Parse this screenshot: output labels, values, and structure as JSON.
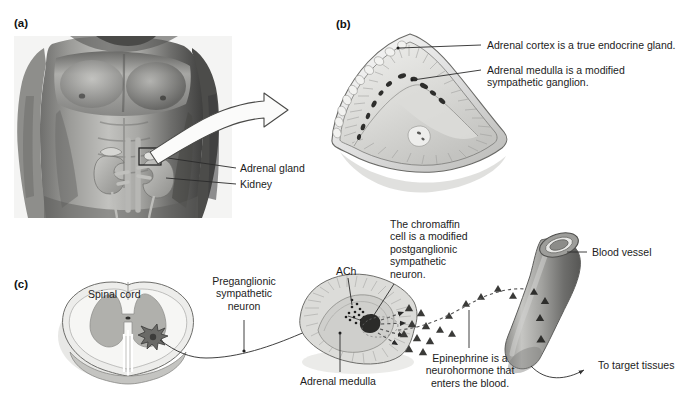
{
  "figure": {
    "background": "#ffffff",
    "ink": "#1c1c1c"
  },
  "panels": [
    {
      "id": "a",
      "letter": "(a)",
      "caption": "Gross anatomy: adrenal glands atop the kidneys"
    },
    {
      "id": "b",
      "letter": "(b)",
      "caption": "Sectioned adrenal gland showing cortex and medulla"
    },
    {
      "id": "c",
      "letter": "(c)",
      "caption": "Sympathetic innervation of the adrenal medulla"
    }
  ],
  "panel_a": {
    "letter": "(a)",
    "labels": [
      {
        "name": "adrenal-gland",
        "text": "Adrenal gland"
      },
      {
        "name": "kidney",
        "text": "Kidney"
      }
    ],
    "arrow": {
      "name": "magnify-arrow",
      "direction": "up-right",
      "style": "white outlined curved block arrow"
    }
  },
  "panel_b": {
    "letter": "(b)",
    "labels": [
      {
        "name": "adrenal-cortex",
        "text": "Adrenal cortex is a true endocrine gland."
      },
      {
        "name": "adrenal-medulla",
        "text": "Adrenal medulla is a modified\nsympathetic ganglion."
      }
    ]
  },
  "panel_c": {
    "letter": "(c)",
    "labels": [
      {
        "name": "spinal-cord",
        "text": "Spinal cord"
      },
      {
        "name": "preganglionic-neuron",
        "text": "Preganglionic\nsympathetic\nneuron"
      },
      {
        "name": "ach",
        "text": "ACh"
      },
      {
        "name": "chromaffin-cell",
        "text": "The chromaffin\ncell is a modified\npostganglionic\nsympathetic\nneuron."
      },
      {
        "name": "adrenal-medulla",
        "text": "Adrenal medulla"
      },
      {
        "name": "epinephrine",
        "text": "Epinephrine is a\nneurohormone that\nenters the blood."
      },
      {
        "name": "blood-vessel",
        "text": "Blood vessel"
      },
      {
        "name": "to-target-tissues",
        "text": "To target tissues"
      }
    ]
  },
  "colors": {
    "tissue_light": "#e6e6e4",
    "tissue_mid": "#c9c9c6",
    "tissue_dark": "#9a9a97",
    "vessel": "#8e8e8c",
    "gray_matter": "#b4b4b0",
    "line": "#2a2a2a",
    "photo_dark": "#3b3b3b"
  }
}
